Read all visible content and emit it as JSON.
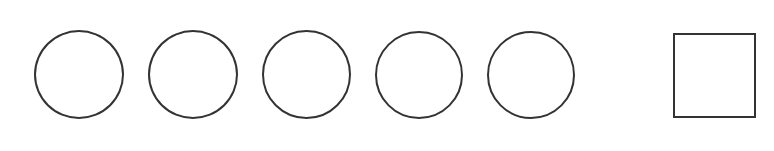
{
  "canvas": {
    "width": 774,
    "height": 151,
    "background_color": "#ffffff",
    "description": "Row of five outlined circles followed by one outlined square"
  },
  "style": {
    "stroke_color": "#333333",
    "stroke_width": 2,
    "fill": "none"
  },
  "shapes": [
    {
      "name": "circle-1",
      "kind": "circle",
      "label": "Circle 1",
      "x": 34,
      "y": 30,
      "width": 90,
      "height": 89,
      "stroke_color": "#333333",
      "stroke_width": 2
    },
    {
      "name": "circle-2",
      "kind": "circle",
      "label": "Circle 2",
      "x": 148,
      "y": 30,
      "width": 90,
      "height": 89,
      "stroke_color": "#333333",
      "stroke_width": 2
    },
    {
      "name": "circle-3",
      "kind": "circle",
      "label": "Circle 3",
      "x": 262,
      "y": 30,
      "width": 89,
      "height": 89,
      "stroke_color": "#333333",
      "stroke_width": 2
    },
    {
      "name": "circle-4",
      "kind": "circle",
      "label": "Circle 4",
      "x": 375,
      "y": 31,
      "width": 88,
      "height": 88,
      "stroke_color": "#333333",
      "stroke_width": 2
    },
    {
      "name": "circle-5",
      "kind": "circle",
      "label": "Circle 5",
      "x": 487,
      "y": 31,
      "width": 88,
      "height": 88,
      "stroke_color": "#333333",
      "stroke_width": 2
    },
    {
      "name": "square-1",
      "kind": "square",
      "label": "Square 1",
      "x": 673,
      "y": 33,
      "width": 83,
      "height": 85,
      "stroke_color": "#333333",
      "stroke_width": 2
    }
  ]
}
